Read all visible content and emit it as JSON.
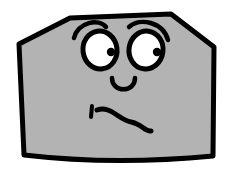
{
  "canvas": {
    "width": 238,
    "height": 172,
    "background_color": "#ffffff",
    "title": "Cartoon rock character with confused face"
  },
  "palette": {
    "body_fill": "#b3b3b3",
    "outline": "#000000",
    "eye_white": "#ffffff",
    "pupil": "#000000",
    "background": "#ffffff"
  },
  "character": {
    "name": "gray-rock-blob",
    "expression": "confused",
    "body": {
      "shape": "beveled-hexagonal-rock",
      "path": "M 24,155 L 19,44 L 70,18 L 171,14 L 214,47 L 213,156 C 150,162 84,162 24,155 Z",
      "stroke_width": 5,
      "fill_color": "#b3b3b3",
      "stroke_color": "#000000"
    },
    "eyebrows": [
      {
        "side": "left",
        "path": "M 74,38 C 78,22 99,18 106,27",
        "stroke_width": 4.5
      },
      {
        "side": "right",
        "path": "M 129,27 C 140,17 163,22 168,40",
        "stroke_width": 4.5
      }
    ],
    "eyes": [
      {
        "side": "left",
        "cx": 100,
        "cy": 50,
        "rx": 17,
        "ry": 19,
        "rotation": -8,
        "stroke_width": 5,
        "pupil": {
          "cx": 111,
          "cy": 52,
          "r": 4.2
        }
      },
      {
        "side": "right",
        "cx": 146,
        "cy": 50,
        "rx": 17,
        "ry": 19,
        "rotation": 8,
        "pupil": {
          "cx": 157,
          "cy": 52,
          "r": 4.2
        },
        "stroke_width": 5
      }
    ],
    "nose": {
      "shape": "u-curve",
      "path": "M 112,78 C 112,93 135,93 135,78",
      "stroke_width": 4.5
    },
    "mouth": {
      "shape": "wavy-squiggle",
      "path": "M 97,110 C 110,105 119,120 131,122 C 142,124 145,132 151,131",
      "stroke_width": 5,
      "tick": {
        "description": "small vertical tick at left end of mouth",
        "path": "M 92,106 L 91,117",
        "stroke_width": 4
      }
    }
  }
}
